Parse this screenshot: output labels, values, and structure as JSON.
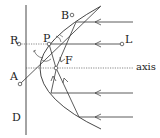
{
  "diagram": {
    "labels": {
      "R": "R",
      "P": "P",
      "L": "L",
      "B": "B",
      "A": "A",
      "F": "F",
      "D": "D",
      "axis": "axis"
    },
    "colors": {
      "stroke": "#333333",
      "background": "#ffffff"
    }
  }
}
